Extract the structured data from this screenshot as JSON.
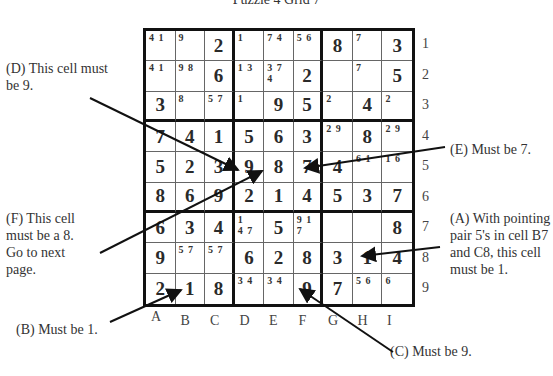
{
  "title": "Puzzle 4 Grid 7",
  "grid": {
    "rows": [
      [
        {
          "v": "",
          "c": "4 1"
        },
        {
          "v": "",
          "c": "9"
        },
        {
          "v": "2",
          "c": ""
        },
        {
          "v": "",
          "c": "1"
        },
        {
          "v": "",
          "c": "7 4"
        },
        {
          "v": "",
          "c": "5 6"
        },
        {
          "v": "8",
          "c": ""
        },
        {
          "v": "",
          "c": "7"
        },
        {
          "v": "3",
          "c": ""
        }
      ],
      [
        {
          "v": "",
          "c": "4 1"
        },
        {
          "v": "",
          "c": "9 8"
        },
        {
          "v": "6",
          "c": ""
        },
        {
          "v": "",
          "c": "1 3"
        },
        {
          "v": "",
          "c": "3 7\n4"
        },
        {
          "v": "2",
          "c": ""
        },
        {
          "v": "",
          "c": ""
        },
        {
          "v": "",
          "c": "7"
        },
        {
          "v": "5",
          "c": ""
        }
      ],
      [
        {
          "v": "3",
          "c": ""
        },
        {
          "v": "",
          "c": "8"
        },
        {
          "v": "",
          "c": "5 7"
        },
        {
          "v": "",
          "c": "1"
        },
        {
          "v": "9",
          "c": ""
        },
        {
          "v": "5",
          "c": ""
        },
        {
          "v": "",
          "c": "2"
        },
        {
          "v": "4",
          "c": ""
        },
        {
          "v": "",
          "c": "2"
        }
      ],
      [
        {
          "v": "7",
          "c": ""
        },
        {
          "v": "4",
          "c": ""
        },
        {
          "v": "1",
          "c": ""
        },
        {
          "v": "5",
          "c": ""
        },
        {
          "v": "6",
          "c": ""
        },
        {
          "v": "3",
          "c": ""
        },
        {
          "v": "",
          "c": "2 9"
        },
        {
          "v": "8",
          "c": ""
        },
        {
          "v": "",
          "c": "2 9"
        }
      ],
      [
        {
          "v": "5",
          "c": ""
        },
        {
          "v": "2",
          "c": ""
        },
        {
          "v": "3",
          "c": ""
        },
        {
          "v": "9",
          "c": ""
        },
        {
          "v": "8",
          "c": ""
        },
        {
          "v": "7",
          "c": ""
        },
        {
          "v": "4",
          "c": ""
        },
        {
          "v": "",
          "c": "6 1"
        },
        {
          "v": "",
          "c": "1 6"
        }
      ],
      [
        {
          "v": "8",
          "c": ""
        },
        {
          "v": "6",
          "c": ""
        },
        {
          "v": "9",
          "c": ""
        },
        {
          "v": "2",
          "c": ""
        },
        {
          "v": "1",
          "c": ""
        },
        {
          "v": "4",
          "c": ""
        },
        {
          "v": "5",
          "c": ""
        },
        {
          "v": "3",
          "c": ""
        },
        {
          "v": "7",
          "c": ""
        }
      ],
      [
        {
          "v": "6",
          "c": ""
        },
        {
          "v": "3",
          "c": ""
        },
        {
          "v": "4",
          "c": ""
        },
        {
          "v": "",
          "c": "1\n4 7"
        },
        {
          "v": "5",
          "c": ""
        },
        {
          "v": "",
          "c": "9 1\n7"
        },
        {
          "v": "",
          "c": ""
        },
        {
          "v": "",
          "c": ""
        },
        {
          "v": "8",
          "c": ""
        }
      ],
      [
        {
          "v": "9",
          "c": ""
        },
        {
          "v": "",
          "c": "5 7"
        },
        {
          "v": "",
          "c": "5 7"
        },
        {
          "v": "6",
          "c": ""
        },
        {
          "v": "2",
          "c": ""
        },
        {
          "v": "8",
          "c": ""
        },
        {
          "v": "3",
          "c": ""
        },
        {
          "v": "1",
          "c": ""
        },
        {
          "v": "4",
          "c": ""
        }
      ],
      [
        {
          "v": "2",
          "c": ""
        },
        {
          "v": "1",
          "c": ""
        },
        {
          "v": "8",
          "c": ""
        },
        {
          "v": "",
          "c": "3 4"
        },
        {
          "v": "",
          "c": "3 4"
        },
        {
          "v": "9",
          "c": ""
        },
        {
          "v": "7",
          "c": ""
        },
        {
          "v": "",
          "c": "5 6"
        },
        {
          "v": "",
          "c": "6"
        }
      ]
    ]
  },
  "row_labels": [
    "1",
    "2",
    "3",
    "4",
    "5",
    "6",
    "7",
    "8",
    "9"
  ],
  "col_labels": [
    "A",
    "B",
    "C",
    "D",
    "E",
    "F",
    "G",
    "H",
    "I"
  ],
  "notes": {
    "A": "(A) With pointing pair 5's in cell B7 and C8, this cell must be 1.",
    "B": "(B) Must be 1.",
    "C": "(C) Must be 9.",
    "D": "(D) This cell must be 9.",
    "E": "(E) Must be 7.",
    "F": "(F) This cell must be a 8. Go to next page."
  }
}
